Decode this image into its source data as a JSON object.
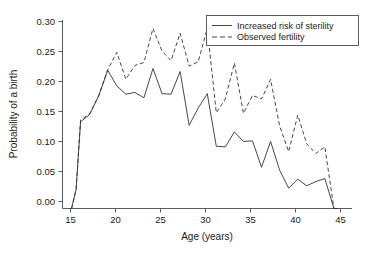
{
  "chart_data": {
    "type": "line",
    "title": "",
    "xlabel": "Age (years)",
    "ylabel": "Probability of a birth",
    "xlim": [
      14,
      46
    ],
    "ylim": [
      0.0,
      0.315
    ],
    "grid": false,
    "legend_position": "top-right",
    "xticks": [
      15,
      20,
      25,
      30,
      35,
      40,
      45
    ],
    "xtick_labels": [
      "15",
      "20",
      "25",
      "30",
      "35",
      "40",
      "45"
    ],
    "yticks": [
      0.0,
      0.05,
      0.1,
      0.15,
      0.2,
      0.25,
      0.3
    ],
    "ytick_labels": [
      "0.00",
      "0.05",
      "0.10",
      "0.15",
      "0.20",
      "0.25",
      "0.30"
    ],
    "x": [
      15,
      15.5,
      16,
      17,
      18,
      19,
      20,
      21,
      22,
      23,
      24,
      25,
      26,
      27,
      28,
      29,
      30,
      31,
      32,
      33,
      34,
      35,
      36,
      37,
      38,
      39,
      40,
      41,
      42,
      43,
      44,
      44.5
    ],
    "series": [
      {
        "name": "Increased risk of sterility",
        "style": "solid",
        "values": [
          0.0,
          0.031,
          0.145,
          0.157,
          0.188,
          0.231,
          0.205,
          0.191,
          0.194,
          0.185,
          0.234,
          0.192,
          0.191,
          0.229,
          0.139,
          0.168,
          0.192,
          0.104,
          0.103,
          0.128,
          0.112,
          0.113,
          0.069,
          0.112,
          0.064,
          0.034,
          0.049,
          0.038,
          0.045,
          0.05,
          0.0,
          0.0
        ]
      },
      {
        "name": "Observed fertility",
        "style": "dashed",
        "values": [
          0.0,
          0.032,
          0.148,
          0.158,
          0.189,
          0.232,
          0.261,
          0.216,
          0.239,
          0.244,
          0.301,
          0.263,
          0.247,
          0.293,
          0.238,
          0.245,
          0.301,
          0.16,
          0.183,
          0.243,
          0.159,
          0.189,
          0.183,
          0.216,
          0.138,
          0.095,
          0.156,
          0.108,
          0.092,
          0.103,
          0.0,
          0.0
        ]
      }
    ],
    "legend_entries": [
      {
        "label": "Increased risk of sterility",
        "style": "solid"
      },
      {
        "label": "Observed fertility",
        "style": "dashed"
      }
    ]
  }
}
